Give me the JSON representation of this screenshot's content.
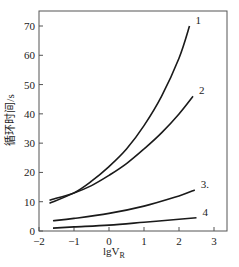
{
  "chart_data": {
    "type": "line",
    "title": "",
    "xlabel": "lgV",
    "xlabel_subscript": "R",
    "ylabel": "循环时间/s",
    "xlim": [
      -2,
      3.5
    ],
    "ylim": [
      0,
      75
    ],
    "xticks": [
      -2,
      -1,
      0,
      1,
      2,
      3
    ],
    "xtick_labels": [
      "−2",
      "−1",
      "0",
      "1",
      "2",
      "3"
    ],
    "yticks": [
      0,
      10,
      20,
      30,
      40,
      50,
      60,
      70
    ],
    "ytick_labels": [
      "0",
      "10",
      "20",
      "30",
      "40",
      "50",
      "60",
      "70"
    ],
    "grid": false,
    "legend": "inline-labels-at-curve-ends",
    "series": [
      {
        "name": "1",
        "x": [
          -1.7,
          -1.0,
          -0.5,
          0,
          0.5,
          1.0,
          1.5,
          2.0,
          2.3
        ],
        "y": [
          9.5,
          13,
          17,
          22,
          28,
          36,
          46,
          59,
          70
        ]
      },
      {
        "name": "2",
        "x": [
          -1.7,
          -1.0,
          -0.5,
          0,
          0.5,
          1.0,
          1.5,
          2.0,
          2.4
        ],
        "y": [
          10.5,
          13,
          15.5,
          19,
          23,
          28,
          33.5,
          40,
          46
        ]
      },
      {
        "name": "3.",
        "x": [
          -1.6,
          -1.0,
          0,
          1.0,
          2.0,
          2.45
        ],
        "y": [
          3.5,
          4.3,
          6,
          8.5,
          12,
          14
        ]
      },
      {
        "name": "4",
        "x": [
          -1.6,
          -1.0,
          0,
          1.0,
          2.0,
          2.5
        ],
        "y": [
          1,
          1.4,
          2,
          3,
          4,
          4.5
        ]
      }
    ]
  }
}
